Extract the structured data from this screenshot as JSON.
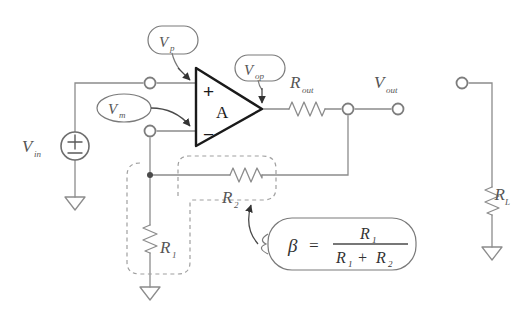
{
  "diagram": {
    "background": "#ffffff",
    "wire_color": "#8c8c8c",
    "amp_color": "#1a1a1a",
    "dashed_color": "#9a9a9a",
    "callout_color": "#6b6b6b"
  },
  "source": {
    "label": "V",
    "sub": "in",
    "symbol": "plus-minus"
  },
  "amplifier": {
    "gain_label": "A",
    "plus_label": "+",
    "minus_label": "−"
  },
  "callouts": [
    {
      "name": "vp",
      "label": "V",
      "sub": "p",
      "shape": "rounded-bubble"
    },
    {
      "name": "vm",
      "label": "V",
      "sub": "m",
      "shape": "oval-bubble"
    },
    {
      "name": "vop",
      "label": "V",
      "sub": "op",
      "shape": "rounded-bubble"
    }
  ],
  "resistors": [
    {
      "name": "r-out",
      "label": "R",
      "sub": "out",
      "orientation": "horizontal"
    },
    {
      "name": "r-two",
      "label": "R",
      "sub": "2",
      "orientation": "horizontal"
    },
    {
      "name": "r-one",
      "label": "R",
      "sub": "1",
      "orientation": "vertical"
    },
    {
      "name": "r-load",
      "label": "R",
      "sub": "L",
      "orientation": "vertical"
    }
  ],
  "nodes": [
    {
      "name": "vout",
      "label": "V",
      "sub": "out"
    }
  ],
  "formula": {
    "beta": "β",
    "equals": "=",
    "numerator": "R",
    "numerator_sub": "1",
    "denominator_left": "R",
    "denominator_left_sub": "1",
    "denominator_op": "+",
    "denominator_right": "R",
    "denominator_right_sub": "2"
  },
  "grounds": [
    {
      "name": "ground-source"
    },
    {
      "name": "ground-r1"
    },
    {
      "name": "ground-rl"
    }
  ]
}
